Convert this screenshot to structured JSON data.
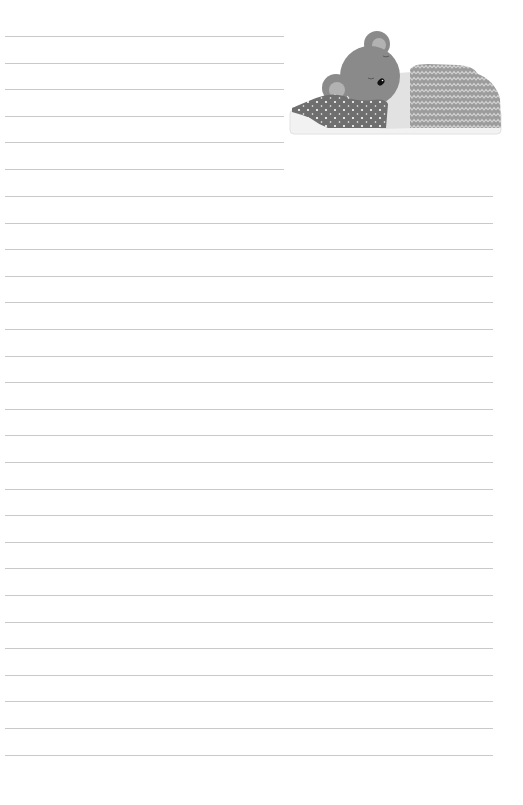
{
  "page": {
    "type": "lined-writing-paper",
    "background": "#ffffff",
    "rule_color": "#c9c9c9"
  },
  "rules": {
    "short": {
      "count": 6,
      "x_start": 5,
      "x_end": 284,
      "y_start": 36,
      "spacing": 26.6
    },
    "long": {
      "count": 22,
      "x_start": 5,
      "x_end": 493,
      "y_start": 196,
      "spacing": 26.6
    }
  },
  "illustration": {
    "subject": "sleeping-bear-under-blanket",
    "colors": {
      "fur": "#8a8a8a",
      "inner_ear": "#b2b2b2",
      "nose": "#111111",
      "scarf": "#6f6f6f",
      "scarf_dots": "#ffffff",
      "blanket": "#9c9c9c",
      "blanket_zigzag": "#cfcfcf",
      "sheet": "#e3e3e3",
      "mattress": "#f1f1f1"
    }
  }
}
